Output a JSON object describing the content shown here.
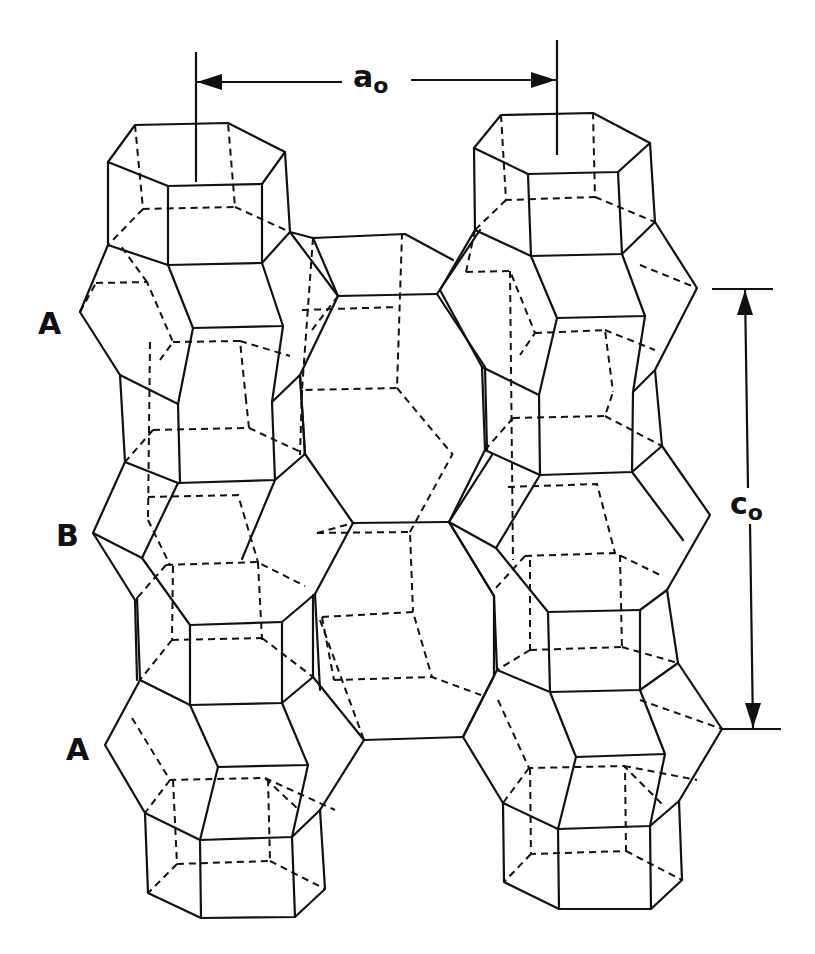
{
  "figure": {
    "type": "crystal-structure-line-drawing",
    "line_color": "#111111",
    "background": "#ffffff"
  },
  "layers": [
    {
      "id": "top",
      "label": "A"
    },
    {
      "id": "middle",
      "label": "B"
    },
    {
      "id": "bottom",
      "label": "A"
    }
  ],
  "dimensions": {
    "a": {
      "symbol": "a",
      "subscript": "o",
      "orientation": "horizontal"
    },
    "c": {
      "symbol": "c",
      "subscript": "o",
      "orientation": "vertical"
    }
  },
  "legend": {
    "solid_line": "front edges",
    "dashed_line": "hidden edges"
  }
}
